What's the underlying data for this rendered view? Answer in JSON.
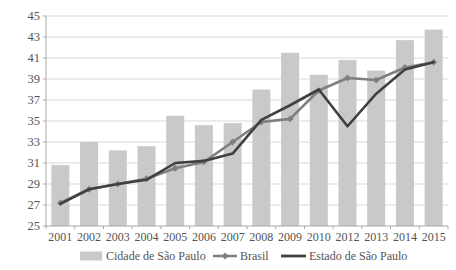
{
  "chart_data": {
    "type": "combo",
    "title": "",
    "xlabel": "",
    "ylabel": "",
    "categories": [
      "2001",
      "2002",
      "2003",
      "2004",
      "2005",
      "2006",
      "2007",
      "2008",
      "2009",
      "2010",
      "2012",
      "2013",
      "2014",
      "2015"
    ],
    "series": [
      {
        "name": "Cidade de São Paulo",
        "kind": "bar",
        "color": "#c9c9c9",
        "values": [
          30.8,
          33.0,
          32.2,
          32.6,
          35.5,
          34.6,
          34.8,
          38.0,
          41.5,
          39.4,
          40.8,
          39.8,
          42.7,
          43.7
        ]
      },
      {
        "name": "Brasil",
        "kind": "line",
        "marker": "diamond",
        "color": "#7f7f7f",
        "values": [
          27.2,
          28.5,
          29.0,
          29.5,
          30.5,
          31.1,
          33.0,
          34.9,
          35.2,
          37.9,
          39.1,
          38.9,
          40.1,
          40.6
        ]
      },
      {
        "name": "Estado de São Paulo",
        "kind": "line",
        "marker": "none",
        "color": "#404040",
        "values": [
          27.1,
          28.5,
          29.0,
          29.4,
          31.0,
          31.2,
          31.9,
          35.1,
          36.5,
          38.0,
          34.5,
          37.6,
          39.9,
          40.6
        ]
      }
    ],
    "ylim": [
      25,
      45
    ],
    "yticks": [
      25,
      27,
      29,
      31,
      33,
      35,
      37,
      39,
      41,
      43,
      45
    ],
    "grid": true,
    "legend_position": "bottom",
    "colors": {
      "grid": "#d9d9d9",
      "axis": "#a8a8a8",
      "text": "#545454",
      "background": "#ffffff"
    }
  }
}
